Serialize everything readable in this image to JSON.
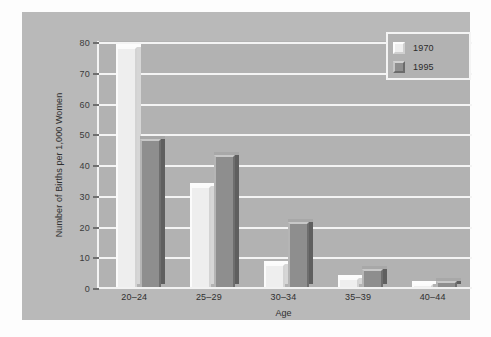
{
  "chart_data": {
    "type": "bar",
    "title": "",
    "xlabel": "Age",
    "ylabel": "Number of Births per 1,000 Women",
    "categories": [
      "20–24",
      "25–29",
      "30–34",
      "35–39",
      "40–44"
    ],
    "series": [
      {
        "name": "1970",
        "values": [
          78,
          33,
          7.5,
          3,
          1
        ]
      },
      {
        "name": "1995",
        "values": [
          48,
          43,
          21,
          6,
          2
        ]
      }
    ],
    "ylim": [
      0,
      80
    ],
    "yticks": [
      0,
      10,
      20,
      30,
      40,
      50,
      60,
      70,
      80
    ],
    "ytick_labels": [
      "0",
      "10",
      "20",
      "30",
      "40",
      "50",
      "60",
      "70",
      "80"
    ],
    "grid": true,
    "legend_position": "top-right",
    "colors": {
      "series_1970": "#eeeeee",
      "series_1995": "#8e8e8e",
      "panel_background": "#b9b9b9",
      "plot_background": "#b2b2b2",
      "gridline": "#f4f4f4",
      "page_background": "#ffffff",
      "text": "#2f2f2f"
    }
  },
  "legend": {
    "entries": [
      {
        "label": "1970",
        "swatch": "legend-swatch-1970"
      },
      {
        "label": "1995",
        "swatch": "legend-swatch-1995"
      }
    ]
  }
}
